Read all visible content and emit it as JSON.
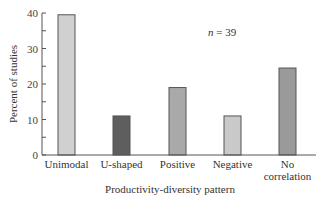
{
  "chart_data": {
    "type": "bar",
    "title": "",
    "xlabel": "Productivity-diversity pattern",
    "ylabel": "Percent of studies",
    "ylim": [
      0,
      40
    ],
    "yticks": [
      0,
      10,
      20,
      30,
      40
    ],
    "grid": false,
    "legend": null,
    "categories": [
      "Unimodal",
      "U-shaped",
      "Positive",
      "Negative",
      "No correlation"
    ],
    "category_lines": [
      [
        "Unimodal"
      ],
      [
        "U-shaped"
      ],
      [
        "Positive"
      ],
      [
        "Negative"
      ],
      [
        "No",
        "correlation"
      ]
    ],
    "values": [
      39.5,
      11,
      19,
      11,
      24.5
    ],
    "bar_colors": [
      "#d0d0d0",
      "#5e5e5e",
      "#a9a9a9",
      "#c9c9c9",
      "#9a9a9a"
    ],
    "annotations": [
      {
        "text": "n = 39",
        "italic_part": "n",
        "rest": " = 39"
      }
    ]
  }
}
